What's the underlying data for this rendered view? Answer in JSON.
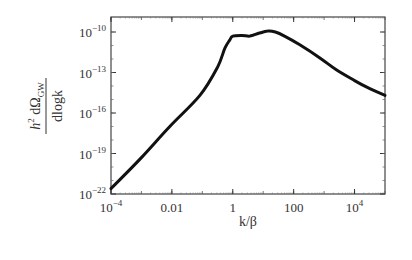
{
  "chart_data": {
    "type": "line",
    "title": "",
    "xlabel": "k/β",
    "ylabel": "h² dΩ_GW / dlogk",
    "ylabel_parts": {
      "numerator_h": "h",
      "numerator_sup": "2",
      "numerator_rest": " dΩ",
      "numerator_sub": "GW",
      "denominator": "dlogk"
    },
    "xscale": "log",
    "yscale": "log",
    "xlim": [
      0.0001,
      100000
    ],
    "ylim": [
      1e-22,
      3e-10
    ],
    "x_ticks": [
      {
        "value": 0.0001,
        "label_base": "10",
        "label_exp": "−4"
      },
      {
        "value": 0.01,
        "label_base": "0.01",
        "label_exp": ""
      },
      {
        "value": 1,
        "label_base": "1",
        "label_exp": ""
      },
      {
        "value": 100,
        "label_base": "100",
        "label_exp": ""
      },
      {
        "value": 10000,
        "label_base": "10",
        "label_exp": "4"
      }
    ],
    "y_ticks": [
      {
        "value": 1e-10,
        "label_base": "10",
        "label_exp": "−10"
      },
      {
        "value": 1e-13,
        "label_base": "10",
        "label_exp": "−13"
      },
      {
        "value": 1e-16,
        "label_base": "10",
        "label_exp": "−16"
      },
      {
        "value": 1e-19,
        "label_base": "10",
        "label_exp": "−19"
      },
      {
        "value": 1e-22,
        "label_base": "10",
        "label_exp": "−22"
      }
    ],
    "grid": false,
    "legend": null,
    "series": [
      {
        "name": "GW spectrum",
        "color": "#111111",
        "log10_x": [
          -4.0,
          -3.0,
          -2.07,
          -1.08,
          -0.5,
          -0.26,
          -0.1,
          0.0,
          0.3,
          0.56,
          0.85,
          1.15,
          1.4,
          1.7,
          2.2,
          2.85,
          3.4,
          4.0,
          4.5,
          5.0
        ],
        "log10_y": [
          -21.6,
          -19.3,
          -17.0,
          -14.7,
          -12.6,
          -11.2,
          -10.6,
          -10.3,
          -10.25,
          -10.3,
          -10.1,
          -9.93,
          -10.0,
          -10.3,
          -10.95,
          -11.9,
          -12.8,
          -13.6,
          -14.2,
          -14.7
        ]
      }
    ]
  }
}
